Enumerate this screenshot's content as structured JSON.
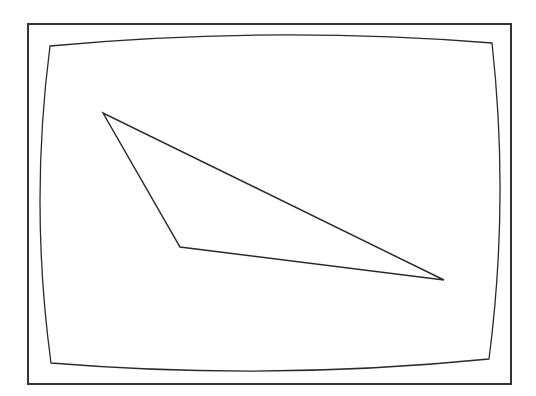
{
  "canvas": {
    "width": 536,
    "height": 396,
    "background": "#ffffff"
  },
  "colors": {
    "stroke": "#2a2a2a",
    "frame": "#333333"
  },
  "frame": {
    "x": 28,
    "y": 24,
    "width": 483,
    "height": 360,
    "stroke_width": 2
  },
  "screen": {
    "corners": {
      "top_left": [
        50,
        46
      ],
      "top_right": [
        492,
        43
      ],
      "bottom_right": [
        489,
        359
      ],
      "bottom_left": [
        51,
        363
      ]
    },
    "bulge": {
      "top_mid_y": 35,
      "bottom_mid_y": 371,
      "left_mid_x": 40,
      "right_mid_x": 500
    },
    "stroke_width": 1.3
  },
  "triangle": {
    "vertices": [
      [
        103,
        113
      ],
      [
        180,
        247
      ],
      [
        444,
        280
      ]
    ],
    "stroke_width": 1.5
  }
}
